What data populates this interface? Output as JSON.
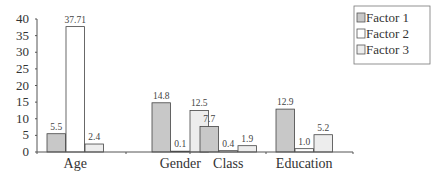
{
  "chart_data": {
    "type": "bar",
    "title": "",
    "xlabel": "",
    "ylabel": "",
    "ylim": [
      0,
      40
    ],
    "yticks": [
      0,
      5,
      10,
      15,
      20,
      25,
      30,
      35,
      40
    ],
    "grid": false,
    "legend_position": "top-right",
    "categories": [
      "Age",
      "Gender",
      "Class",
      "Education"
    ],
    "series": [
      {
        "name": "Factor 1",
        "color": "#c8c8c8",
        "values": [
          5.5,
          14.8,
          7.7,
          12.9
        ],
        "labels": [
          "5.5",
          "14.8",
          "7.7",
          "12.9"
        ]
      },
      {
        "name": "Factor 2",
        "color": "#ffffff",
        "values": [
          37.71,
          0.1,
          0.4,
          1.0
        ],
        "labels": [
          "37.71",
          "0.1",
          "0.4",
          "1.0"
        ]
      },
      {
        "name": "Factor 3",
        "color": "#ededed",
        "values": [
          2.4,
          12.5,
          1.9,
          5.2
        ],
        "labels": [
          "2.4",
          "12.5",
          "1.9",
          "5.2"
        ]
      }
    ]
  }
}
